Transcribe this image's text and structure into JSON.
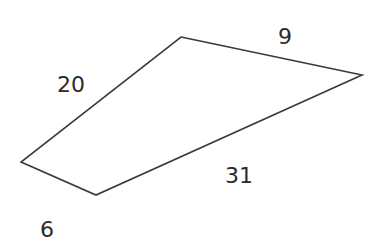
{
  "diagram": {
    "type": "quadrilateral",
    "stroke_color": "#3a3a3a",
    "label_color": "#2b2b2b",
    "background": "#ffffff",
    "vertices": [
      {
        "id": "top",
        "x": 181,
        "y": 37
      },
      {
        "id": "right",
        "x": 362,
        "y": 75
      },
      {
        "id": "bottom",
        "x": 96,
        "y": 195
      },
      {
        "id": "left",
        "x": 21,
        "y": 162
      }
    ],
    "sides": [
      {
        "id": "top-left-side",
        "from": "left",
        "to": "top",
        "label": "20",
        "label_x": 57,
        "label_y": 92
      },
      {
        "id": "top-right-side",
        "from": "top",
        "to": "right",
        "label": "9",
        "label_x": 278,
        "label_y": 44
      },
      {
        "id": "bottom-right-side",
        "from": "right",
        "to": "bottom",
        "label": "31",
        "label_x": 225,
        "label_y": 183
      },
      {
        "id": "bottom-left-side",
        "from": "bottom",
        "to": "left",
        "label": "6",
        "label_x": 40,
        "label_y": 237
      }
    ]
  }
}
